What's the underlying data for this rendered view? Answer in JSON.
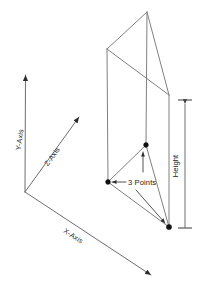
{
  "diagram": {
    "background_color": "#ffffff",
    "edge_color": "#808080",
    "axis_color": "#6e6e6e",
    "leader_color": "#404040",
    "text_color": "#1a1a1a",
    "labels": {
      "y_axis": "Y-Axis",
      "z_axis": "Z-Axis",
      "x_axis": "X-Axis",
      "height": "Height",
      "three_points": "3 Points"
    },
    "axes": {
      "origin": {
        "x": 25,
        "y": 192
      },
      "y_axis_tip": {
        "x": 25,
        "y": 72
      },
      "z_axis_tip": {
        "x": 82,
        "y": 115
      },
      "x_axis_tip": {
        "x": 154,
        "y": 277
      }
    },
    "prism": {
      "top_apex": {
        "x": 147,
        "y": 12
      },
      "top_left": {
        "x": 107,
        "y": 49
      },
      "top_right": {
        "x": 169,
        "y": 95
      },
      "bottom_middle": {
        "x": 146,
        "y": 145
      },
      "bottom_left": {
        "x": 108,
        "y": 182
      },
      "bottom_right": {
        "x": 169,
        "y": 227
      }
    },
    "dimension": {
      "line_x": 185,
      "top_y": 100,
      "bottom_y": 228
    },
    "point_markers": [
      {
        "x": 146,
        "y": 145
      },
      {
        "x": 108,
        "y": 182
      },
      {
        "x": 169,
        "y": 227
      }
    ]
  }
}
